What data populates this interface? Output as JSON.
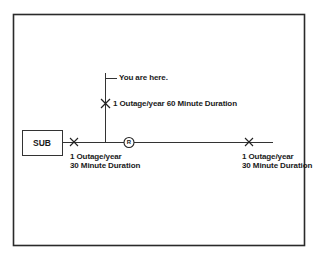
{
  "diagram": {
    "type": "single-line-distribution-feeder",
    "colors": {
      "line": "#222222",
      "background": "#ffffff"
    },
    "substation": {
      "label": "SUB"
    },
    "recloser": {
      "label": "R"
    },
    "you_are_here": "You are here.",
    "faults": [
      {
        "id": "feeder-near-sub",
        "line1": "1 Outage/year",
        "line2": "30 Minute Duration"
      },
      {
        "id": "lateral",
        "text": "1 Outage/year 60 Minute Duration"
      },
      {
        "id": "feeder-far",
        "line1": "1 Outage/year",
        "line2": "30 Minute Duration"
      }
    ]
  }
}
